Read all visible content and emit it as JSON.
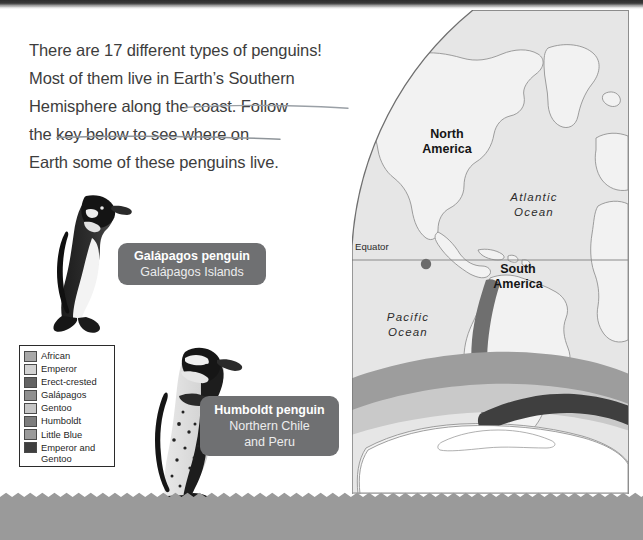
{
  "page": {
    "background_color": "#ffffff",
    "width": 643,
    "height": 540
  },
  "intro": {
    "lines": [
      "There are 17 different types of penguins!",
      "Most of them live in Earth’s Southern",
      "Hemisphere along the coast. Follow",
      "the key below to see where on",
      "Earth some of these penguins live."
    ],
    "text_color": "#3d3d3d",
    "underlines": [
      "Earth’s Southern",
      "Hemisphere along the coast."
    ]
  },
  "callouts": [
    {
      "id": "galapagos",
      "title": "Galápagos penguin",
      "subtitle": "Galápagos Islands",
      "background_color": "#6f7072",
      "text_color": "#ffffff"
    },
    {
      "id": "humboldt",
      "title": "Humboldt penguin",
      "subtitle": "Northern Chile\nand Peru",
      "background_color": "#6f7072",
      "text_color": "#ffffff"
    }
  ],
  "legend": {
    "border_color": "#2b2b2b",
    "background_color": "#ffffff",
    "items": [
      {
        "label": "African",
        "color": "#a8a8a8"
      },
      {
        "label": "Emperor",
        "color": "#d3d3d3"
      },
      {
        "label": "Erect-crested",
        "color": "#636363"
      },
      {
        "label": "Galápagos",
        "color": "#8f8f8f"
      },
      {
        "label": "Gentoo",
        "color": "#c6c6c6"
      },
      {
        "label": "Humboldt",
        "color": "#7d7d7d"
      },
      {
        "label": "Little Blue",
        "color": "#9a9a9a"
      },
      {
        "label": "Emperor and\nGentoo",
        "color": "#3f3f3f"
      }
    ]
  },
  "map": {
    "ocean_color": "#e6e6e6",
    "land_color": "#f1f1f1",
    "outline_color": "#8e8e8e",
    "equator_label": "Equator",
    "equator_line_color": "#8a8a8a",
    "marker": {
      "label": "Galápagos Islands marker",
      "color": "#6b6b6b"
    },
    "labels": [
      {
        "text": "North\nAmerica",
        "style": "bold"
      },
      {
        "text": "South\nAmerica",
        "style": "bold"
      },
      {
        "text": "Atlantic\nOcean",
        "style": "italic"
      },
      {
        "text": "Pacific\nOcean",
        "style": "italic"
      }
    ],
    "range_bands": [
      {
        "name": "humboldt-coast-strip",
        "color": "#6f6f6f"
      },
      {
        "name": "antarctic-band-light",
        "color": "#c9c9c9"
      },
      {
        "name": "antarctic-band-mid",
        "color": "#9d9d9d"
      },
      {
        "name": "antarctic-band-dark",
        "color": "#3f3f3f"
      }
    ]
  },
  "bottom_band": {
    "color": "#9a9a9a",
    "edge": "zigzag-scallop"
  },
  "penguins": [
    {
      "id": "galapagos-penguin-photo",
      "alt": "Galápagos penguin photo"
    },
    {
      "id": "humboldt-penguin-photo",
      "alt": "Humboldt penguin photo"
    }
  ]
}
